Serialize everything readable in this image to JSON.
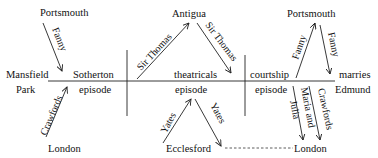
{
  "diagram": {
    "places": {
      "portsmouth_left": "Portsmouth",
      "mansfield": "Mansfield",
      "park": "Park",
      "london_left": "London",
      "antigua": "Antigua",
      "ecclesford": "Ecclesford",
      "portsmouth_right": "Portsmouth",
      "london_right": "London"
    },
    "episodes": {
      "sotherton": "Sotherton",
      "sotherton_ep": "episode",
      "theatricals": "theatricals",
      "theatricals_ep": "episode",
      "courtship": "courtship",
      "courtship_ep": "episode",
      "marries": "marries",
      "edmund": "Edmund"
    },
    "arrows": {
      "fanny_left": "Fanny",
      "crawfords_left": "Crawfords",
      "sir_thomas_up": "Sir Thomas",
      "sir_thomas_down": "Sir Thomas",
      "yates_up": "Yates",
      "yates_down": "Yates",
      "fanny_up": "Fanny",
      "fanny_down": "Fanny",
      "maria_and": "Maria and",
      "julia": "Julia",
      "crawfords_right": "Crawfords"
    }
  }
}
